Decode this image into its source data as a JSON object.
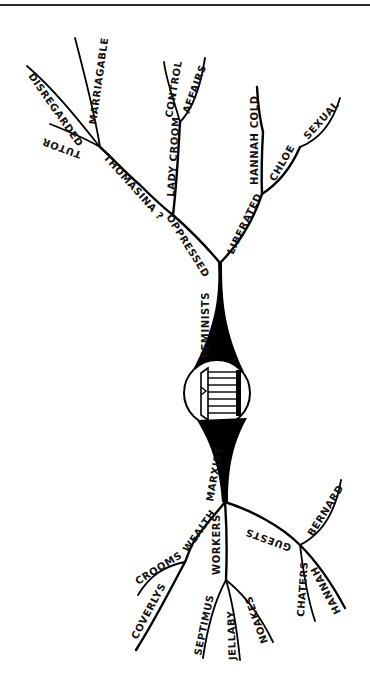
{
  "header": {
    "text": "Chapter heading (faint, cropped)"
  },
  "central_node": {
    "icon": "temple-icon",
    "label": ""
  },
  "diagram": {
    "upper_main": "FEMINISTS",
    "lower_main": "MARXIST",
    "oppressed": {
      "label": "OPPRESSED",
      "thomasina": {
        "label": "THOMASINA ?",
        "children": [
          "TUTOR",
          "DISREGARDED",
          "MARRIAGABLE"
        ]
      },
      "lady_croom": {
        "label": "LADY CROOM",
        "children": [
          "CONTROL",
          "AFFAIRS"
        ]
      }
    },
    "liberated": {
      "label": "LIBERATED",
      "hannah": {
        "label": "HANNAH COLD"
      },
      "chloe": {
        "label": "CHLOE",
        "children": [
          "SEXUAL"
        ]
      }
    },
    "wealth": {
      "label": "WEALTH",
      "children": [
        "CROOMS",
        "COVERLYS"
      ]
    },
    "workers": {
      "label": "WORKERS",
      "children": [
        "SEPTIMUS",
        "JELLABY",
        "NOAKES"
      ]
    },
    "guests": {
      "label": "GUESTS",
      "children": [
        "BERNARD",
        "CHATERS",
        "HANNAH"
      ]
    }
  }
}
